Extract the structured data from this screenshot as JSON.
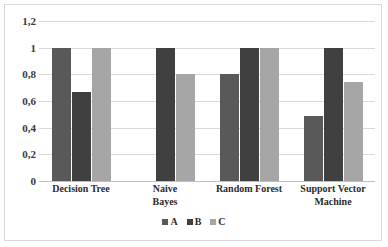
{
  "chart_data": {
    "type": "bar",
    "title": "",
    "xlabel": "",
    "ylabel": "",
    "ylim": [
      0,
      1.2
    ],
    "ytick_labels": [
      "1,2",
      "1",
      "0,8",
      "0,6",
      "0,4",
      "0,2",
      "0"
    ],
    "ytick_values": [
      1.2,
      1.0,
      0.8,
      0.6,
      0.4,
      0.2,
      0
    ],
    "grid": true,
    "legend_position": "bottom",
    "decimal_separator": ",",
    "categories": [
      "Decision Tree",
      "Naive Bayes",
      "Random Forest",
      "Support Vector Machine"
    ],
    "category_lines": [
      [
        "Decision Tree"
      ],
      [
        "Naive",
        "Bayes"
      ],
      [
        "Random Forest"
      ],
      [
        "Support Vector",
        "Machine"
      ]
    ],
    "series": [
      {
        "name": "A",
        "color": "#595959",
        "values": [
          1.0,
          null,
          0.8,
          0.49
        ]
      },
      {
        "name": "B",
        "color": "#404040",
        "values": [
          0.67,
          1.0,
          1.0,
          1.0
        ]
      },
      {
        "name": "C",
        "color": "#A6A6A6",
        "values": [
          1.0,
          0.8,
          1.0,
          0.74
        ]
      }
    ],
    "legend": [
      {
        "label": "A",
        "color": "#595959"
      },
      {
        "label": "B",
        "color": "#404040"
      },
      {
        "label": "C",
        "color": "#A6A6A6"
      }
    ]
  },
  "colors": {
    "series_a": "#595959",
    "series_b": "#404040",
    "series_c": "#A6A6A6",
    "gridline": "#d9d9d9",
    "border": "#d9d9d9",
    "text": "#2b2b2b",
    "background": "#ffffff"
  }
}
